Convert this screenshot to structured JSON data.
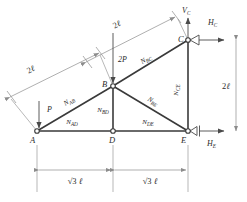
{
  "figure": {
    "nodes": [
      {
        "id": "A",
        "label": "A",
        "x": 37,
        "y": 131
      },
      {
        "id": "B",
        "label": "B",
        "x": 113,
        "y": 86
      },
      {
        "id": "C",
        "label": "C",
        "x": 188,
        "y": 40
      },
      {
        "id": "D",
        "label": "D",
        "x": 113,
        "y": 131
      },
      {
        "id": "E",
        "label": "E",
        "x": 188,
        "y": 131
      }
    ],
    "members": [
      {
        "id": "AB",
        "label": "N",
        "sub": "AB",
        "from": "A",
        "to": "B",
        "label_x": 70,
        "label_y": 103
      },
      {
        "id": "BC",
        "label": "N",
        "sub": "BC",
        "from": "B",
        "to": "C",
        "label_x": 147,
        "label_y": 61
      },
      {
        "id": "AD",
        "label": "N",
        "sub": "AD",
        "from": "A",
        "to": "D",
        "label_x": 72,
        "label_y": 124
      },
      {
        "id": "DE",
        "label": "N",
        "sub": "DE",
        "from": "D",
        "to": "E",
        "label_x": 148,
        "label_y": 124
      },
      {
        "id": "BD",
        "label": "N",
        "sub": "BD",
        "from": "B",
        "to": "D",
        "label_x": 103,
        "label_y": 112
      },
      {
        "id": "BE",
        "label": "N",
        "sub": "BE",
        "from": "B",
        "to": "E",
        "label_x": 152,
        "label_y": 103
      },
      {
        "id": "CE",
        "label": "N",
        "sub": "CE",
        "from": "C",
        "to": "E",
        "label_x": 177,
        "label_y": 90
      }
    ],
    "loads": [
      {
        "id": "P",
        "label": "P",
        "sub": "",
        "direction": "down",
        "at_node": "A",
        "label_x": 46,
        "label_y": 112
      },
      {
        "id": "2P",
        "label": "2P",
        "sub": "",
        "direction": "down",
        "at_node": "B",
        "label_x": 120,
        "label_y": 63
      }
    ],
    "reactions": [
      {
        "id": "VC",
        "label": "V",
        "sub": "C",
        "direction": "up",
        "at_node": "C",
        "label_x": 186,
        "label_y": 12
      },
      {
        "id": "HC",
        "label": "H",
        "sub": "C",
        "direction": "right",
        "at_node": "C",
        "label_x": 215,
        "label_y": 22
      },
      {
        "id": "HE",
        "label": "H",
        "sub": "E",
        "direction": "right",
        "at_node": "E",
        "label_x": 216,
        "label_y": 146
      }
    ],
    "supports": [
      {
        "at_node": "C",
        "type": "pin-hinge"
      },
      {
        "at_node": "E",
        "type": "roller"
      }
    ],
    "dimensions": [
      {
        "id": "dim-AB-slant",
        "value": "2",
        "unit": "ℓ",
        "orientation": "slant",
        "label_x": 32,
        "label_y": 72
      },
      {
        "id": "dim-BC-slant",
        "value": "2",
        "unit": "ℓ",
        "orientation": "slant",
        "label_x": 118,
        "label_y": 27
      },
      {
        "id": "dim-CE-vert",
        "value": "2",
        "unit": "ℓ",
        "orientation": "vertical",
        "label_x": 225,
        "label_y": 88
      },
      {
        "id": "dim-AD-horiz",
        "value": "√3 ",
        "unit": "ℓ",
        "orientation": "horizontal",
        "label_x": 63,
        "label_y": 182
      },
      {
        "id": "dim-DE-horiz",
        "value": "√3 ",
        "unit": "ℓ",
        "orientation": "horizontal",
        "label_x": 139,
        "label_y": 182
      }
    ],
    "colors": {
      "member": "#3a3a3a",
      "dimension": "#8c8c8c",
      "force": "#4a4a4a",
      "text": "#2b2b2b",
      "background": "#ffffff"
    }
  }
}
